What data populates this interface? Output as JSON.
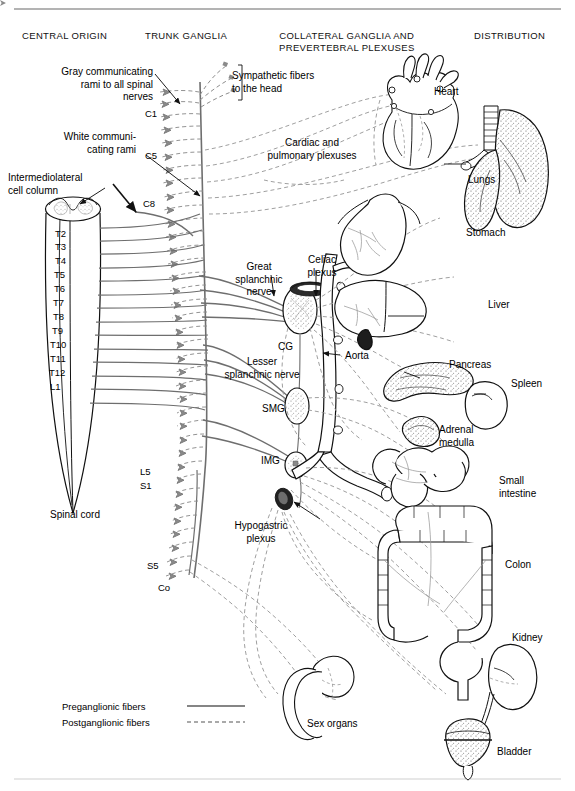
{
  "figure": {
    "background": "#ffffff",
    "fiber_colors": {
      "preganglionic": "#6e6e6e",
      "postganglionic": "#8c8c8c",
      "outline": "#111111"
    }
  },
  "column_headings": [
    {
      "id": "central-origin",
      "text": "CENTRAL ORIGIN",
      "x": 22,
      "y": 30
    },
    {
      "id": "trunk-ganglia",
      "text": "TRUNK GANGLIA",
      "x": 145,
      "y": 30
    },
    {
      "id": "collateral-ganglia",
      "text": "COLLATERAL GANGLIA AND\nPREVERTEBRAL PLEXUSES",
      "x": 279,
      "y": 30
    },
    {
      "id": "distribution",
      "text": "DISTRIBUTION",
      "x": 474,
      "y": 30
    }
  ],
  "callouts": [
    {
      "id": "gray-rami",
      "text": "Gray communicating\nrami to all spinal\nnerves",
      "align": "right"
    },
    {
      "id": "white-rami",
      "text": "White communi-\ncating rami",
      "align": "right"
    },
    {
      "id": "intermediolateral",
      "text": "Intermediolateral\ncell column",
      "align": "left"
    },
    {
      "id": "sympathetic-head",
      "text": "Sympathetic fibers\nto the head",
      "align": "left"
    },
    {
      "id": "cardiac-pulmonary",
      "text": "Cardiac and\npulmonary plexuses",
      "align": "center"
    },
    {
      "id": "great-splanchnic",
      "text": "Great\nsplanchnic\nnerve",
      "align": "center"
    },
    {
      "id": "celiac-plexus",
      "text": "Celiac\nplexus",
      "align": "center"
    },
    {
      "id": "lesser-splanchnic",
      "text": "Lesser\nsplanchnic nerve",
      "align": "center"
    },
    {
      "id": "hypogastric-plexus",
      "text": "Hypogastric\nplexus",
      "align": "center"
    },
    {
      "id": "spinal-cord",
      "text": "Spinal cord",
      "align": "center"
    },
    {
      "id": "aorta",
      "text": "Aorta",
      "align": "left"
    }
  ],
  "ganglion_labels": [
    {
      "id": "cg",
      "text": "CG"
    },
    {
      "id": "smg",
      "text": "SMG"
    },
    {
      "id": "img",
      "text": "IMG"
    }
  ],
  "spinal_segments": {
    "cord_column": [
      "T2",
      "T3",
      "T4",
      "T5",
      "T6",
      "T7",
      "T8",
      "T9",
      "T10",
      "T11",
      "T12",
      "L1"
    ],
    "chain_markers": [
      "C1",
      "C5",
      "C8",
      "L5",
      "S1",
      "S5",
      "Co"
    ]
  },
  "organs": [
    {
      "id": "heart",
      "label": "Heart"
    },
    {
      "id": "lungs",
      "label": "Lungs"
    },
    {
      "id": "stomach",
      "label": "Stomach"
    },
    {
      "id": "liver",
      "label": "Liver"
    },
    {
      "id": "pancreas",
      "label": "Pancreas"
    },
    {
      "id": "spleen",
      "label": "Spleen"
    },
    {
      "id": "adrenal-medulla",
      "label": "Adrenal\nmedulla"
    },
    {
      "id": "small-intestine",
      "label": "Small\nintestine"
    },
    {
      "id": "colon",
      "label": "Colon"
    },
    {
      "id": "kidney",
      "label": "Kidney"
    },
    {
      "id": "bladder",
      "label": "Bladder"
    },
    {
      "id": "sex-organs",
      "label": "Sex organs"
    }
  ],
  "legend": {
    "items": [
      {
        "id": "preganglionic",
        "label": "Preganglionic fibers",
        "style": "solid"
      },
      {
        "id": "postganglionic",
        "label": "Postganglionic fibers",
        "style": "dashed"
      }
    ]
  }
}
